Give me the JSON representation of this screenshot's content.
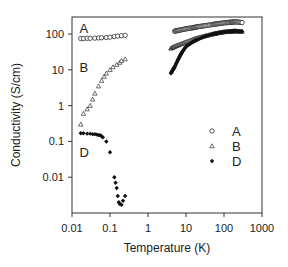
{
  "chart_data": {
    "type": "scatter",
    "title": "",
    "xlabel": "Temperature (K)",
    "ylabel": "Conductivity (S/cm)",
    "xscale": "log",
    "yscale": "log",
    "xlim": [
      0.01,
      1000
    ],
    "ylim": [
      0.001,
      300
    ],
    "x_ticks": [
      0.01,
      0.1,
      1,
      10,
      100,
      1000
    ],
    "x_tick_labels": [
      "0.01",
      "0.1",
      "1",
      "10",
      "100",
      "1000"
    ],
    "y_ticks": [
      0.01,
      0.1,
      1,
      10,
      100
    ],
    "y_tick_labels": [
      "0.01",
      "0.1",
      "1",
      "10",
      "100"
    ],
    "grid": false,
    "legend_position": "lower right (inside)",
    "annotations": [
      {
        "text": "A",
        "x": 0.02,
        "y": 150
      },
      {
        "text": "B",
        "x": 0.02,
        "y": 12
      },
      {
        "text": "D",
        "x": 0.02,
        "y": 0.05
      }
    ],
    "series": [
      {
        "name": "A",
        "marker": "open-circle",
        "x": [
          0.017,
          0.02,
          0.025,
          0.03,
          0.04,
          0.05,
          0.06,
          0.08,
          0.1,
          0.13,
          0.16,
          0.2,
          0.25,
          5,
          7,
          10,
          15,
          20,
          30,
          50,
          70,
          100,
          150,
          200,
          300
        ],
        "y": [
          75,
          75,
          76,
          76,
          77,
          78,
          79,
          80,
          82,
          85,
          88,
          90,
          92,
          120,
          130,
          140,
          150,
          160,
          170,
          185,
          195,
          205,
          215,
          220,
          210
        ]
      },
      {
        "name": "B",
        "marker": "open-triangle",
        "x": [
          0.017,
          0.02,
          0.025,
          0.03,
          0.035,
          0.04,
          0.05,
          0.06,
          0.07,
          0.08,
          0.1,
          0.12,
          0.15,
          0.18,
          0.2,
          0.25,
          4,
          5,
          7,
          10,
          15,
          20,
          30,
          50,
          70,
          100,
          150,
          200,
          300
        ],
        "y": [
          0.3,
          0.6,
          0.8,
          1.0,
          1.5,
          2.2,
          3.5,
          5,
          6.5,
          8,
          10,
          12,
          14,
          16,
          18,
          20,
          40,
          45,
          52,
          60,
          70,
          78,
          88,
          100,
          108,
          115,
          120,
          122,
          118
        ]
      },
      {
        "name": "D",
        "marker": "filled-diamond",
        "x": [
          0.017,
          0.02,
          0.025,
          0.03,
          0.035,
          0.04,
          0.045,
          0.05,
          0.055,
          0.06,
          0.065,
          0.08,
          0.1,
          0.13,
          0.14,
          0.15,
          0.16,
          0.17,
          0.18,
          0.2,
          0.22,
          0.25,
          4,
          4.5,
          5,
          6,
          7,
          8,
          10,
          15,
          20,
          30,
          50,
          70,
          100,
          150,
          200,
          300
        ],
        "y": [
          0.17,
          0.17,
          0.165,
          0.165,
          0.16,
          0.16,
          0.155,
          0.15,
          0.15,
          0.14,
          0.13,
          0.1,
          0.05,
          0.01,
          0.007,
          0.005,
          0.003,
          0.002,
          0.0018,
          0.0017,
          0.0022,
          0.003,
          8,
          10,
          12,
          18,
          25,
          32,
          45,
          60,
          70,
          85,
          100,
          108,
          115,
          120,
          122,
          118
        ]
      }
    ]
  },
  "legend": {
    "items": [
      {
        "label": "A",
        "marker": "open-circle"
      },
      {
        "label": "B",
        "marker": "open-triangle"
      },
      {
        "label": "D",
        "marker": "filled-diamond"
      }
    ]
  },
  "colors": {
    "axis": "#333333",
    "markers": "#111111",
    "background": "#ffffff"
  }
}
